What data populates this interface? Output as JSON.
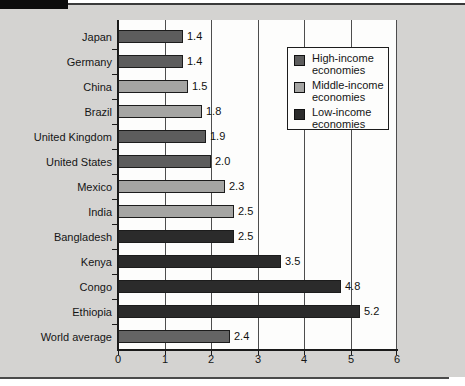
{
  "figure": {
    "background_color": "#d4d3d1",
    "plot_background_color": "#fdfdfc",
    "top_tab_color": "#0c0c0c",
    "rule_color": "#3a3a3a"
  },
  "chart_data": {
    "type": "bar",
    "orientation": "horizontal",
    "title": "",
    "xlabel": "",
    "ylabel": "",
    "xlim": [
      0,
      6
    ],
    "x_ticks": [
      "0",
      "1",
      "2",
      "3",
      "4",
      "5",
      "6"
    ],
    "grid": true,
    "legend_position": "upper-right",
    "categories": [
      "Japan",
      "Germany",
      "China",
      "Brazil",
      "United Kingdom",
      "United States",
      "Mexico",
      "India",
      "Bangladesh",
      "Kenya",
      "Congo",
      "Ethiopia",
      "World average"
    ],
    "values": [
      1.4,
      1.4,
      1.5,
      1.8,
      1.9,
      2.0,
      2.3,
      2.5,
      2.5,
      3.5,
      4.8,
      5.2,
      2.4
    ],
    "value_labels": [
      "1.4",
      "1.4",
      "1.5",
      "1.8",
      "1.9",
      "2.0",
      "2.3",
      "2.5",
      "2.5",
      "3.5",
      "4.8",
      "5.2",
      "2.4"
    ],
    "groups": [
      "high",
      "high",
      "middle",
      "middle",
      "high",
      "high",
      "middle",
      "middle",
      "low",
      "low",
      "low",
      "low",
      "world"
    ],
    "group_colors": {
      "high": "#5d5d5d",
      "middle": "#a5a5a3",
      "low": "#2b2b2b",
      "world": "#646464"
    },
    "legend": [
      {
        "label": "High-income economies",
        "group": "high"
      },
      {
        "label": "Middle-income economies",
        "group": "middle"
      },
      {
        "label": "Low-income economies",
        "group": "low"
      }
    ]
  }
}
